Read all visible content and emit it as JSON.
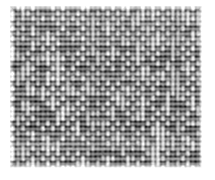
{
  "image": {
    "kind": "texture-photograph",
    "subject": "woven fabric weave",
    "description": "Grayscale close-up of a plain-woven textile (canvas / burlap style) showing a regular basket-weave grid of light warp and dark weft yarns",
    "colorspace": "grayscale",
    "canvas": {
      "width": 215,
      "height": 180,
      "background": "#ffffff"
    },
    "swatch": {
      "left": 10,
      "top": 6,
      "width": 192,
      "height": 162,
      "border": "none"
    },
    "weave": {
      "pattern": "plain-weave",
      "cell_period_px": 5,
      "warp_count": 39,
      "weft_count": 33,
      "thread_thickness_px": 2,
      "irregularity": 0.42
    },
    "tones": {
      "darkest": "#1a1a1a",
      "dark": "#333333",
      "mid_dark": "#555555",
      "mid": "#7d7d7d",
      "mid_light": "#a5a5a5",
      "light": "#cfcfcf",
      "lightest": "#f2f2f2",
      "paper": "#ffffff"
    },
    "noise": {
      "seed": 20240617,
      "grain_amplitude": 34,
      "blur_radius_px": 0.9
    }
  }
}
